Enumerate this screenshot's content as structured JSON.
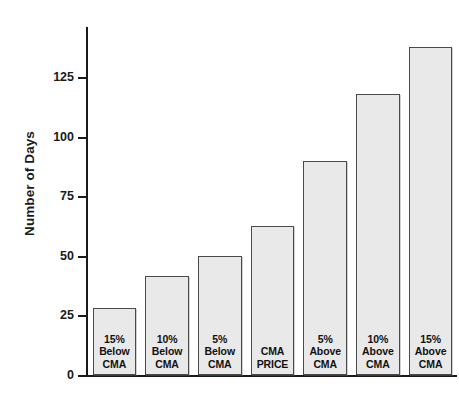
{
  "chart_data": {
    "type": "bar",
    "title": "",
    "xlabel": "",
    "ylabel": "Number of Days",
    "ylim": [
      0,
      140
    ],
    "yticks": [
      0,
      25,
      50,
      75,
      100,
      125
    ],
    "ytick_labels": [
      "0",
      "25",
      "50",
      "75",
      "100",
      "125"
    ],
    "grid": false,
    "legend": "none",
    "categories": [
      "15% Below CMA",
      "10% Below CMA",
      "5% Below CMA",
      "CMA PRICE",
      "5% Above CMA",
      "10% Above CMA",
      "15% Above CMA"
    ],
    "category_lines": [
      [
        "15%",
        "Below",
        "CMA"
      ],
      [
        "10%",
        "Below",
        "CMA"
      ],
      [
        "5%",
        "Below",
        "CMA"
      ],
      [
        "CMA",
        "PRICE"
      ],
      [
        "5%",
        "Above",
        "CMA"
      ],
      [
        "10%",
        "Above",
        "CMA"
      ],
      [
        "15%",
        "Above",
        "CMA"
      ]
    ],
    "values": [
      27,
      40,
      48,
      60,
      86,
      113,
      132
    ],
    "bar_fill": "#e9e9e9",
    "bar_border": "#4a4a4a",
    "axis_color": "#1a1a1a"
  }
}
